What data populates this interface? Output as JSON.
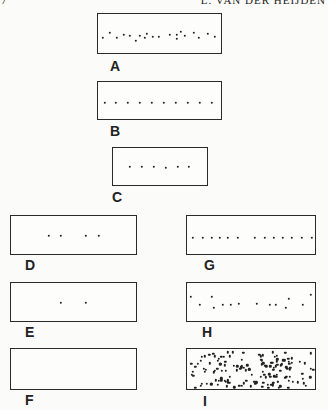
{
  "header": {
    "page_mark": "7",
    "running_head": "L. VAN DER HEIJDEN"
  },
  "panels": [
    {
      "id": "A",
      "label": "A",
      "box": [
        97,
        13,
        125,
        41
      ],
      "label_pos": [
        110,
        59
      ],
      "dots": [
        [
          5,
          24
        ],
        [
          12,
          19
        ],
        [
          19,
          24
        ],
        [
          26,
          21
        ],
        [
          32,
          22
        ],
        [
          38,
          27
        ],
        [
          42,
          22
        ],
        [
          47,
          24
        ],
        [
          49,
          20
        ],
        [
          55,
          23
        ],
        [
          61,
          23
        ],
        [
          72,
          21
        ],
        [
          79,
          21
        ],
        [
          79,
          25
        ],
        [
          83,
          18
        ],
        [
          87,
          22
        ],
        [
          96,
          19
        ],
        [
          101,
          24
        ],
        [
          110,
          20
        ],
        [
          117,
          23
        ]
      ]
    },
    {
      "id": "B",
      "label": "B",
      "box": [
        97,
        81,
        125,
        39
      ],
      "label_pos": [
        110,
        124
      ],
      "dots": [
        [
          7,
          21
        ],
        [
          18,
          21
        ],
        [
          30,
          21
        ],
        [
          42,
          21
        ],
        [
          54,
          21
        ],
        [
          66,
          21
        ],
        [
          78,
          21
        ],
        [
          90,
          21
        ],
        [
          102,
          21
        ],
        [
          114,
          21
        ]
      ]
    },
    {
      "id": "C",
      "label": "C",
      "box": [
        112,
        147,
        96,
        39
      ],
      "label_pos": [
        112,
        190
      ],
      "dots": [
        [
          17,
          19
        ],
        [
          29,
          19
        ],
        [
          41,
          19
        ],
        [
          53,
          20
        ],
        [
          65,
          19
        ],
        [
          76,
          19
        ]
      ]
    },
    {
      "id": "D",
      "label": "D",
      "box": [
        10,
        215,
        127,
        40
      ],
      "label_pos": [
        25,
        258
      ],
      "dots": [
        [
          38,
          20
        ],
        [
          50,
          20
        ],
        [
          75,
          20
        ],
        [
          88,
          20
        ]
      ]
    },
    {
      "id": "G",
      "label": "G",
      "box": [
        186,
        215,
        130,
        40
      ],
      "label_pos": [
        204,
        258
      ],
      "dots": [
        [
          6,
          22
        ],
        [
          16,
          22
        ],
        [
          25,
          22
        ],
        [
          33,
          22
        ],
        [
          41,
          22
        ],
        [
          51,
          22
        ],
        [
          68,
          22
        ],
        [
          78,
          22
        ],
        [
          87,
          22
        ],
        [
          96,
          22
        ],
        [
          105,
          22
        ],
        [
          115,
          22
        ],
        [
          125,
          22
        ]
      ]
    },
    {
      "id": "E",
      "label": "E",
      "box": [
        10,
        282,
        127,
        40
      ],
      "label_pos": [
        25,
        325
      ],
      "dots": [
        [
          50,
          20
        ],
        [
          75,
          20
        ]
      ]
    },
    {
      "id": "H",
      "label": "H",
      "box": [
        186,
        282,
        130,
        40
      ],
      "label_pos": [
        202,
        325
      ],
      "dots": [
        [
          4,
          14
        ],
        [
          13,
          22
        ],
        [
          25,
          14
        ],
        [
          27,
          25
        ],
        [
          36,
          22
        ],
        [
          44,
          22
        ],
        [
          52,
          21
        ],
        [
          70,
          21
        ],
        [
          83,
          22
        ],
        [
          89,
          22
        ],
        [
          99,
          25
        ],
        [
          102,
          16
        ],
        [
          116,
          22
        ],
        [
          124,
          12
        ]
      ]
    },
    {
      "id": "F",
      "label": "F",
      "box": [
        10,
        348,
        127,
        42
      ],
      "label_pos": [
        25,
        393
      ],
      "dots": []
    },
    {
      "id": "I",
      "label": "I",
      "box": [
        186,
        348,
        130,
        42
      ],
      "label_pos": [
        203,
        394
      ],
      "dots": "dense-random"
    }
  ]
}
